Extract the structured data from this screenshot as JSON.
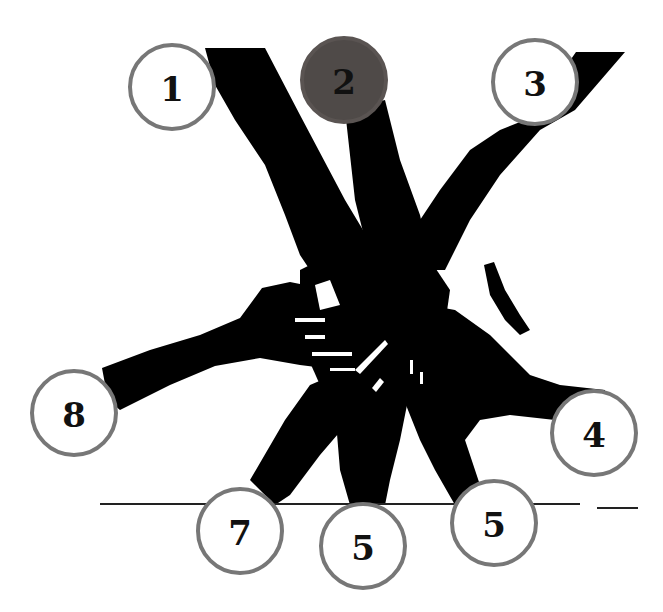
{
  "figure": {
    "highlighted_badge": "2",
    "colors": {
      "silhouette": "#000000",
      "ring": "#777777",
      "highlight_fill": "#4f4a48",
      "badge_fill": "#ffffff",
      "label": "#111111"
    }
  },
  "badges": [
    {
      "label": "1",
      "x": 172,
      "y": 87,
      "active": false
    },
    {
      "label": "2",
      "x": 344,
      "y": 80,
      "active": true
    },
    {
      "label": "3",
      "x": 535,
      "y": 82,
      "active": false
    },
    {
      "label": "4",
      "x": 594,
      "y": 433,
      "active": false
    },
    {
      "label": "5",
      "x": 494,
      "y": 523,
      "active": false
    },
    {
      "label": "5",
      "x": 363,
      "y": 546,
      "active": false
    },
    {
      "label": "7",
      "x": 240,
      "y": 531,
      "active": false
    },
    {
      "label": "8",
      "x": 74,
      "y": 413,
      "active": false
    }
  ],
  "baselines": [
    {
      "x": 100,
      "y": 503,
      "width": 480
    },
    {
      "x": 597,
      "y": 507,
      "width": 41
    }
  ]
}
